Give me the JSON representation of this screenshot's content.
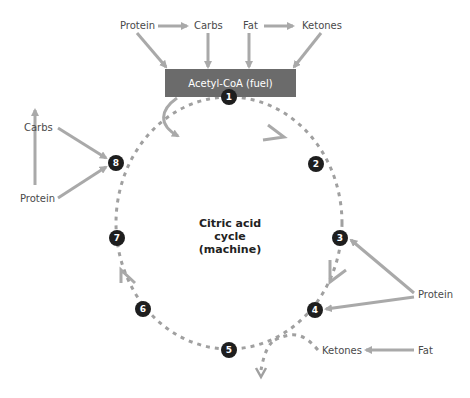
{
  "diagram": {
    "fuel_box": {
      "label": "Acetyl-CoA (fuel)",
      "color": "#6b6b6b"
    },
    "center_label": {
      "line1": "Citric acid",
      "line2": "cycle",
      "line3": "(machine)"
    },
    "top_inputs": [
      {
        "label": "Protein"
      },
      {
        "label": "Carbs"
      },
      {
        "label": "Fat"
      },
      {
        "label": "Ketones"
      }
    ],
    "left_inputs": {
      "carbs": "Carbs",
      "protein": "Protein"
    },
    "right_inputs": {
      "protein": "Protein",
      "ketones": "Ketones",
      "fat": "Fat"
    },
    "nodes": [
      "1",
      "2",
      "3",
      "4",
      "5",
      "6",
      "7",
      "8"
    ],
    "colors": {
      "arrow": "#a9a9a9",
      "dash": "#a0a0a0",
      "node": "#1e1e1e",
      "text": "#4a4a4a"
    }
  }
}
